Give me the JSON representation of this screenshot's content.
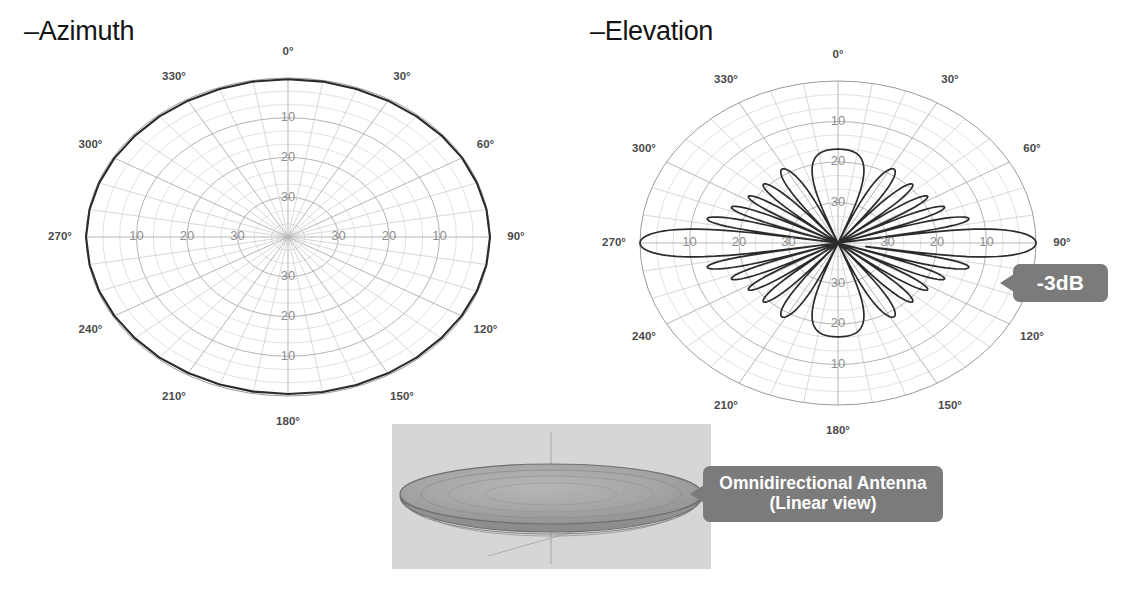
{
  "page": {
    "background": "#ffffff",
    "width": 1137,
    "height": 590
  },
  "colors": {
    "callout_bg": "#7b7b7b",
    "callout_text": "#ffffff",
    "grid": "#b9b9b9",
    "pattern": "#2b2b2b",
    "angle_label": "#4a4a4a",
    "ring_label": "#8e8e8e",
    "panel3d_bg": "#d6d6d6"
  },
  "panels": {
    "azimuth": {
      "title": "–Azimuth",
      "angle_labels": [
        "0°",
        "30°",
        "60°",
        "90°",
        "120°",
        "150°",
        "180°",
        "210°",
        "240°",
        "270°",
        "300°",
        "330°"
      ],
      "ring_labels_vertical": [
        "10",
        "20",
        "30",
        "30",
        "20",
        "10"
      ],
      "ring_labels_horizontal": [
        "10",
        "20",
        "30",
        "30",
        "20",
        "10"
      ]
    },
    "elevation": {
      "title": "–Elevation",
      "angle_labels": [
        "0°",
        "30°",
        "60°",
        "90°",
        "120°",
        "150°",
        "180°",
        "210°",
        "240°",
        "270°",
        "300°",
        "330°"
      ],
      "ring_labels_vertical": [
        "10",
        "20",
        "30",
        "30",
        "20",
        "10"
      ],
      "ring_labels_horizontal": [
        "10",
        "20",
        "30",
        "30",
        "20",
        "10"
      ]
    }
  },
  "callouts": {
    "minus3db": {
      "label": "-3dB"
    },
    "omni": {
      "line1": "Omnidirectional Antenna",
      "line2": "(Linear view)"
    }
  },
  "chart_data": [
    {
      "type": "line",
      "subtype": "polar-radiation-pattern",
      "title": "–Azimuth",
      "xlabel": "Azimuth angle (degrees)",
      "ylabel": "Relative gain (dB below peak)",
      "angle_unit": "degrees",
      "radial_unit": "dB below peak",
      "radial_tick_labels": [
        "10",
        "20",
        "30"
      ],
      "radial_ticks_db": [
        10,
        20,
        30
      ],
      "radial_direction": "inward",
      "rlim_db": [
        0,
        40
      ],
      "grid": true,
      "legend": "none",
      "angle_ticks": [
        0,
        30,
        60,
        90,
        120,
        150,
        180,
        210,
        240,
        270,
        300,
        330
      ],
      "angles_deg": [
        0,
        10,
        20,
        30,
        40,
        50,
        60,
        70,
        80,
        90,
        100,
        110,
        120,
        130,
        140,
        150,
        160,
        170,
        180,
        190,
        200,
        210,
        220,
        230,
        240,
        250,
        260,
        270,
        280,
        290,
        300,
        310,
        320,
        330,
        340,
        350
      ],
      "values_db_below_peak": [
        0.3,
        0.3,
        0.4,
        0.4,
        0.4,
        0.3,
        0.2,
        0.2,
        0.1,
        0.0,
        0.1,
        0.2,
        0.3,
        0.4,
        0.4,
        0.4,
        0.4,
        0.4,
        0.5,
        0.5,
        0.5,
        0.5,
        0.4,
        0.4,
        0.3,
        0.2,
        0.1,
        0.0,
        0.1,
        0.2,
        0.3,
        0.4,
        0.4,
        0.4,
        0.4,
        0.3
      ],
      "description": "Near-circular omnidirectional azimuth pattern, essentially uniform at 0 dB in all directions"
    },
    {
      "type": "line",
      "subtype": "polar-radiation-pattern",
      "title": "–Elevation",
      "xlabel": "Elevation angle (degrees)",
      "ylabel": "Relative gain (dB below peak)",
      "angle_unit": "degrees",
      "radial_unit": "dB below peak",
      "radial_tick_labels": [
        "10",
        "20",
        "30"
      ],
      "radial_ticks_db": [
        10,
        20,
        30
      ],
      "radial_direction": "inward",
      "rlim_db": [
        0,
        40
      ],
      "grid": true,
      "legend": "none",
      "annotation": "-3dB",
      "angle_ticks": [
        0,
        30,
        60,
        90,
        120,
        150,
        180,
        210,
        240,
        270,
        300,
        330
      ],
      "main_lobes_deg": [
        90,
        270
      ],
      "main_lobe_peak_db": 0,
      "sidelobe_angles_deg": [
        50,
        62,
        74,
        106,
        118,
        130,
        230,
        242,
        254,
        286,
        298,
        310
      ],
      "sidelobe_levels_db": [
        21,
        18,
        14,
        14,
        18,
        21,
        21,
        18,
        14,
        14,
        18,
        21
      ],
      "null_angles_deg": [
        0,
        180,
        44,
        56,
        68,
        80,
        100,
        112,
        124,
        136,
        224,
        236,
        248,
        260,
        280,
        292,
        304,
        316
      ],
      "beamwidth_3db_deg": 7,
      "description": "Narrow elevation pattern: two main lobes along 90 and 270 degrees with a series of symmetric sidelobes; -3dB point marked at the 90-degree main lobe edge"
    }
  ],
  "antenna3d": {
    "caption_line1": "Omnidirectional Antenna",
    "caption_line2": "(Linear view)",
    "shape": "flattened-disc-torus"
  }
}
